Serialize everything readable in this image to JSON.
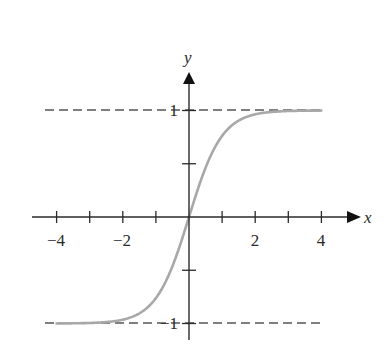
{
  "chart_data": {
    "type": "line",
    "title": "",
    "xlabel": "x",
    "ylabel": "y",
    "function": "tanh(x)",
    "xlim": [
      -4,
      4
    ],
    "ylim": [
      -1,
      1
    ],
    "x_ticks": [
      -4,
      -3,
      -2,
      -1,
      0,
      1,
      2,
      3,
      4
    ],
    "x_tick_labels": [
      "−4",
      "−2",
      "2",
      "4"
    ],
    "x_tick_label_values": [
      -4,
      -2,
      2,
      4
    ],
    "y_ticks": [
      -1,
      -0.5,
      0.5,
      1
    ],
    "y_tick_labels": [
      "−1",
      "1"
    ],
    "y_tick_label_values": [
      -1,
      1
    ],
    "asymptotes": [
      {
        "y": 1,
        "style": "dashed"
      },
      {
        "y": -1,
        "style": "dashed"
      }
    ],
    "series": [
      {
        "name": "tanh(x)",
        "color": "#a8a8a8",
        "x": [
          -4,
          -3,
          -2.5,
          -2,
          -1.5,
          -1,
          -0.5,
          0,
          0.5,
          1,
          1.5,
          2,
          2.5,
          3,
          4
        ],
        "y": [
          -0.999,
          -0.995,
          -0.987,
          -0.964,
          -0.905,
          -0.762,
          -0.462,
          0,
          0.462,
          0.762,
          0.905,
          0.964,
          0.987,
          0.995,
          0.999
        ]
      }
    ],
    "grid": false,
    "legend": null
  },
  "labels": {
    "x_axis": "x",
    "y_axis": "y",
    "x_neg4": "−4",
    "x_neg2": "−2",
    "x_2": "2",
    "x_4": "4",
    "y_1": "1",
    "y_neg1": "−1"
  },
  "colors": {
    "axis": "#2a2a2a",
    "curve": "#a8a8a8",
    "asymptote": "#555555"
  }
}
